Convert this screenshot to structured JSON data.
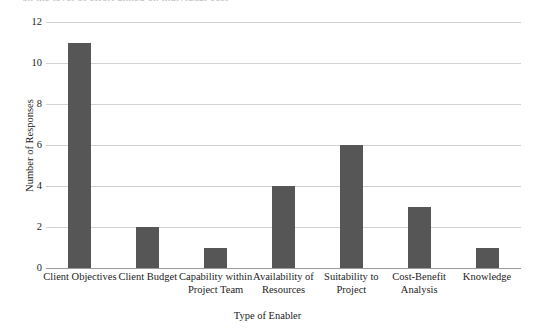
{
  "caption": {
    "text": "on the level of effort aimed on individual cost"
  },
  "chart_data": {
    "type": "bar",
    "title": "",
    "subtitle": "",
    "xlabel": "Type of Enabler",
    "ylabel": "Number of Responses",
    "categories": [
      "Client Objectives",
      "Client Budget",
      "Capability within Project Team",
      "Availability of Resources",
      "Suitability to Project",
      "Cost-Benefit Analysis",
      "Knowledge"
    ],
    "category_lines": [
      [
        "Client Objectives"
      ],
      [
        "Client Budget"
      ],
      [
        "Capability within",
        "Project Team"
      ],
      [
        "Availability of",
        "Resources"
      ],
      [
        "Suitability to",
        "Project"
      ],
      [
        "Cost-Benefit",
        "Analysis"
      ],
      [
        "Knowledge"
      ]
    ],
    "values": [
      11,
      2,
      1,
      4,
      6,
      3,
      1
    ],
    "ylim": [
      0,
      12
    ],
    "yticks": [
      0,
      2,
      4,
      6,
      8,
      10,
      12
    ],
    "ytick_labels": [
      "0",
      "2",
      "4",
      "6",
      "8",
      "10",
      "12"
    ],
    "grid": true,
    "legend": false,
    "legend_position": "none",
    "bar_color": "#565656",
    "grid_color": "#d2d2d2",
    "axis_color": "#9a9a9a"
  }
}
